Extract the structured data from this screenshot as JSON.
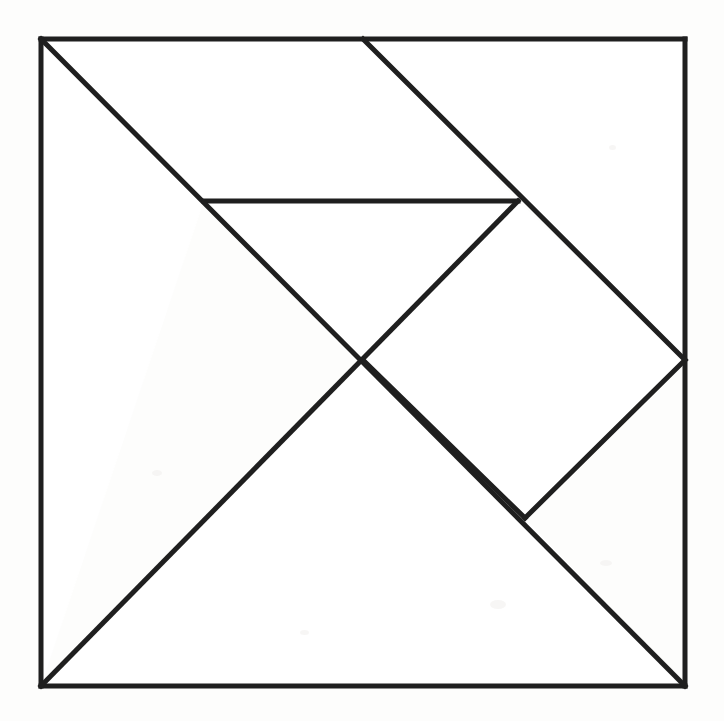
{
  "figure": {
    "kind": "line-drawing",
    "background_color": "#fdfdfc",
    "paper_color": "#ffffff",
    "stroke_color": "#1f1f1f",
    "stroke_width": 5,
    "outline_stroke_width": 5,
    "canvas": {
      "width": 724,
      "height": 721
    }
  },
  "square": {
    "name": "tangram-square",
    "top_left": {
      "x": 41,
      "y": 39
    },
    "top_right": {
      "x": 685,
      "y": 39
    },
    "bottom_right": {
      "x": 685,
      "y": 686
    },
    "bottom_left": {
      "x": 41,
      "y": 686
    },
    "width": 644,
    "height": 647
  },
  "vertices": {
    "A_top_left": {
      "x": 41,
      "y": 39
    },
    "B_top_mid": {
      "x": 363,
      "y": 39
    },
    "C_top_right": {
      "x": 685,
      "y": 39
    },
    "D_right_mid": {
      "x": 685,
      "y": 360
    },
    "E_bottom_right": {
      "x": 685,
      "y": 686
    },
    "F_bottom_left": {
      "x": 41,
      "y": 686
    },
    "G_center": {
      "x": 363,
      "y": 360
    },
    "H_upper_left_mid": {
      "x": 204,
      "y": 201
    },
    "I_upper_right_mid": {
      "x": 518,
      "y": 201
    },
    "J_lower_right_mid": {
      "x": 525,
      "y": 518
    }
  },
  "edges": [
    {
      "name": "square-top-edge",
      "from": "A_top_left",
      "to": "C_top_right"
    },
    {
      "name": "square-right-edge",
      "from": "C_top_right",
      "to": "E_bottom_right"
    },
    {
      "name": "square-bottom-edge",
      "from": "E_bottom_right",
      "to": "F_bottom_left"
    },
    {
      "name": "square-left-edge",
      "from": "F_bottom_left",
      "to": "A_top_left"
    },
    {
      "name": "main-diagonal",
      "from": "A_top_left",
      "to": "E_bottom_right"
    },
    {
      "name": "upper-diagonal",
      "from": "B_top_mid",
      "to": "D_right_mid"
    },
    {
      "name": "horizontal-cut",
      "from": "H_upper_left_mid",
      "to": "I_upper_right_mid"
    },
    {
      "name": "anti-diagonal",
      "from": "I_upper_right_mid",
      "to": "F_bottom_left"
    },
    {
      "name": "center-to-lower-right",
      "from": "G_center",
      "to": "J_lower_right_mid"
    },
    {
      "name": "lower-right-to-right-mid",
      "from": "J_lower_right_mid",
      "to": "D_right_mid"
    }
  ],
  "pieces": [
    {
      "name": "large-triangle-left",
      "type": "large-triangle",
      "points": "41,39 204,201 41,686"
    },
    {
      "name": "large-triangle-bottom",
      "type": "large-triangle",
      "points": "41,686 363,360 685,686"
    },
    {
      "name": "medium-triangle-top",
      "type": "medium-triangle",
      "points": "204,201 518,201 363,360"
    },
    {
      "name": "small-triangle-top",
      "type": "small-triangle",
      "points": "363,39 685,39 685,360"
    },
    {
      "name": "parallelogram-upper",
      "type": "parallelogram",
      "points": "41,39 363,39 518,201 204,201"
    },
    {
      "name": "square-tan-center",
      "type": "square",
      "points": "363,360 518,201 685,360 525,518"
    },
    {
      "name": "small-triangle-right",
      "type": "small-triangle",
      "points": "363,360 525,518 685,686"
    }
  ],
  "specks": [
    {
      "x": 490,
      "y": 600,
      "w": 16,
      "h": 9
    },
    {
      "x": 152,
      "y": 470,
      "w": 10,
      "h": 6
    },
    {
      "x": 609,
      "y": 145,
      "w": 7,
      "h": 5
    },
    {
      "x": 300,
      "y": 630,
      "w": 9,
      "h": 5
    },
    {
      "x": 600,
      "y": 560,
      "w": 12,
      "h": 6
    }
  ]
}
